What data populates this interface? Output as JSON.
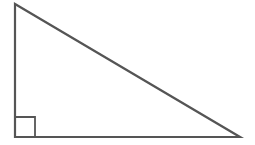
{
  "diagram": {
    "type": "right-triangle",
    "stroke_color": "#555555",
    "background": "#ffffff",
    "vertices": {
      "top": [
        15,
        4
      ],
      "right_angle": [
        15,
        137
      ],
      "right": [
        240,
        137
      ]
    },
    "right_angle_marker": {
      "size": 20,
      "position": "bottom-left"
    },
    "labels": []
  }
}
